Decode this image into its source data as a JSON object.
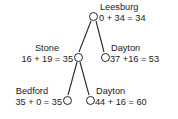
{
  "diagram": {
    "type": "binary-search-tree",
    "title": "",
    "background_color": "#ffffff",
    "stroke_color": "#262626",
    "text_color": "#1a1a1a",
    "node_fill": "#ffffff",
    "nodes": [
      {
        "id": "leesburg",
        "name": "Leesburg",
        "calc": "0 + 34 = 34",
        "g": 0,
        "h": 34,
        "f": 34,
        "label_side": "right",
        "cx": 93,
        "cy": 16
      },
      {
        "id": "stone",
        "name": "Stone",
        "calc": "16 + 19 = 35",
        "g": 16,
        "h": 19,
        "f": 35,
        "label_side": "left",
        "cx": 78,
        "cy": 57
      },
      {
        "id": "dayton-mid",
        "name": "Dayton",
        "calc": "37 +16 = 53",
        "g": 37,
        "h": 16,
        "f": 53,
        "label_side": "right",
        "cx": 105,
        "cy": 57
      },
      {
        "id": "bedford",
        "name": "Bedford",
        "calc": "35 + 0 = 35",
        "g": 35,
        "h": 0,
        "f": 35,
        "label_side": "left",
        "cx": 67,
        "cy": 100
      },
      {
        "id": "dayton-low",
        "name": "Dayton",
        "calc": "44 + 16 = 60",
        "g": 44,
        "h": 16,
        "f": 60,
        "label_side": "right",
        "cx": 90,
        "cy": 100
      }
    ],
    "edges": [
      {
        "id": "leesburg-stone",
        "from": "leesburg",
        "to": "stone",
        "x1": 91,
        "y1": 21,
        "x2": 79,
        "y2": 52
      },
      {
        "id": "leesburg-dayton-mid",
        "from": "leesburg",
        "to": "dayton-mid",
        "x1": 96,
        "y1": 21,
        "x2": 104,
        "y2": 52
      },
      {
        "id": "stone-bedford",
        "from": "stone",
        "to": "bedford",
        "x1": 77,
        "y1": 62,
        "x2": 68,
        "y2": 95
      },
      {
        "id": "stone-dayton-low",
        "from": "stone",
        "to": "dayton-low",
        "x1": 80,
        "y1": 62,
        "x2": 89,
        "y2": 95
      }
    ]
  }
}
